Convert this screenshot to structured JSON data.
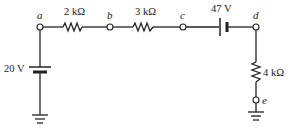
{
  "diagram": {
    "type": "circuit",
    "nodes": [
      {
        "id": "a",
        "label": "a"
      },
      {
        "id": "b",
        "label": "b"
      },
      {
        "id": "c",
        "label": "c"
      },
      {
        "id": "d",
        "label": "d"
      },
      {
        "id": "e",
        "label": "e"
      }
    ],
    "components": {
      "r1": {
        "type": "resistor",
        "label": "2 kΩ",
        "between": [
          "a",
          "b"
        ]
      },
      "r2": {
        "type": "resistor",
        "label": "3 kΩ",
        "between": [
          "b",
          "c"
        ]
      },
      "v1": {
        "type": "battery",
        "label": "47 V",
        "between": [
          "c",
          "d"
        ]
      },
      "r3": {
        "type": "resistor",
        "label": "4 kΩ",
        "between": [
          "d",
          "e"
        ]
      },
      "v2": {
        "type": "battery",
        "label": "20 V",
        "between": [
          "a",
          "ground"
        ]
      }
    },
    "grounds": [
      "left-ground",
      "right-ground"
    ],
    "colors": {
      "line": "#222222",
      "background": "#ffffff"
    }
  }
}
